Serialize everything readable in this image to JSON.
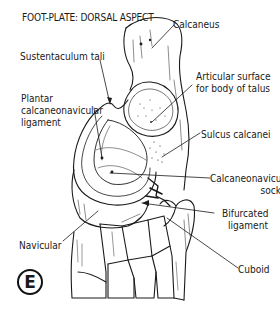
{
  "figure": {
    "title": "FOOT-PLATE: DORSAL ASPECT",
    "panel_letter": "E"
  },
  "labels": {
    "calcaneus": "Calcaneus",
    "sustentaculum_tali": "Sustentaculum tali",
    "articular_surface_line1": "Articular surface",
    "articular_surface_line2": "for body of talus",
    "plantar_ligament_line1": "Plantar",
    "plantar_ligament_line2": "calcaneonavicular",
    "plantar_ligament_line3": "ligament",
    "sulcus_calcanei": "Sulcus calcanei",
    "socket_line1": "Calcaneonavicular",
    "socket_line2": "socket",
    "bifurcated_line1": "Bifurcated",
    "bifurcated_line2": "ligament",
    "navicular": "Navicular",
    "cuboid": "Cuboid"
  },
  "colors": {
    "ink": "#1a1a1a",
    "background": "#ffffff"
  }
}
